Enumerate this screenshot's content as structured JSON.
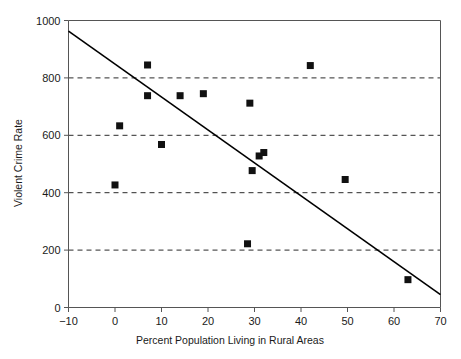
{
  "chart_data": {
    "type": "scatter",
    "title": "",
    "xlabel": "Percent Population Living in Rural Areas",
    "ylabel": "Violent Crime Rate",
    "xlim": [
      -10,
      70
    ],
    "ylim": [
      0,
      1000
    ],
    "xticks": [
      -10,
      0,
      10,
      20,
      30,
      40,
      50,
      60,
      70
    ],
    "xtick_labels": [
      "−10",
      "0",
      "10",
      "20",
      "30",
      "40",
      "50",
      "60",
      "70"
    ],
    "yticks": [
      0,
      200,
      400,
      600,
      800,
      1000
    ],
    "ytick_labels": [
      "0",
      "200",
      "400",
      "600",
      "800",
      "1000"
    ],
    "gridlines_y": [
      200,
      400,
      600,
      800
    ],
    "grid": "horizontal-dashed",
    "legend": "none",
    "marker": "filled-square",
    "marker_color": "#111111",
    "line_color": "#000000",
    "axis_color": "#555555",
    "points": [
      {
        "x": 0.0,
        "y": 427
      },
      {
        "x": 1.0,
        "y": 633
      },
      {
        "x": 7.0,
        "y": 845
      },
      {
        "x": 7.0,
        "y": 738
      },
      {
        "x": 10.0,
        "y": 568
      },
      {
        "x": 14.0,
        "y": 738
      },
      {
        "x": 19.0,
        "y": 745
      },
      {
        "x": 28.5,
        "y": 222
      },
      {
        "x": 29.5,
        "y": 477
      },
      {
        "x": 29.0,
        "y": 712
      },
      {
        "x": 31.0,
        "y": 528
      },
      {
        "x": 32.0,
        "y": 540
      },
      {
        "x": 42.0,
        "y": 843
      },
      {
        "x": 49.5,
        "y": 446
      },
      {
        "x": 63.0,
        "y": 97
      }
    ],
    "trendline": {
      "type": "linear",
      "x_start": -10,
      "y_start": 963,
      "x_end": 70,
      "y_end": 45
    }
  }
}
